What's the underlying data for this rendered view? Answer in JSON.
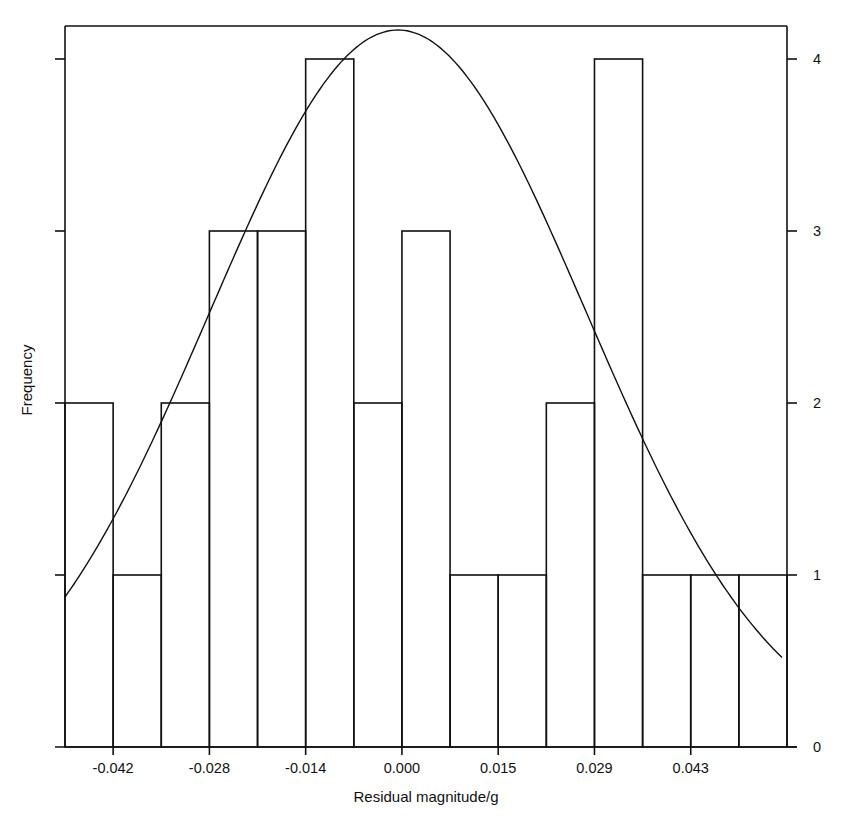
{
  "chart_data": {
    "type": "bar",
    "subtype": "histogram_with_normal_curve",
    "title": "",
    "xlabel": "Residual magnitude/g",
    "ylabel": "Frequency",
    "x_tick_labels": [
      "-0.042",
      "-0.028",
      "-0.014",
      "0.000",
      "0.015",
      "0.029",
      "0.043"
    ],
    "y_tick_labels_right": [
      "0",
      "1",
      "2",
      "3",
      "4"
    ],
    "ylim": [
      0,
      4.16
    ],
    "grid": false,
    "legend": null,
    "bin_count": 15,
    "values": [
      2,
      1,
      2,
      3,
      3,
      4,
      2,
      3,
      1,
      1,
      2,
      4,
      1,
      1,
      1
    ],
    "normal_curve": {
      "description": "Fitted normal distribution overlay",
      "peak_x": -0.001,
      "peak_frequency": 4.0,
      "left_end_frequency": 0.87,
      "right_end_frequency": 0.54
    }
  },
  "labels": {
    "x_axis": "Residual magnitude/g",
    "y_axis": "Frequency"
  }
}
